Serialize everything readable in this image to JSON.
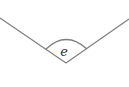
{
  "diagram": {
    "type": "angle",
    "angle_label": "e",
    "line_color": "#808080",
    "label_color": "#333333"
  }
}
